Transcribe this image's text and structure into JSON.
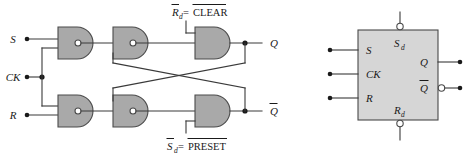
{
  "figure": {
    "colors": {
      "background": "#ffffff",
      "gate_fill": "#a9a9a9",
      "gate_stroke": "#4a4a4a",
      "wire": "#3a3a3a",
      "text": "#1a1a1a",
      "block_fill": "#d6d6d6",
      "block_stroke": "#4a4a4a"
    }
  },
  "circuit": {
    "inputs": [
      {
        "label": "S",
        "name": "input-s"
      },
      {
        "label": "CK",
        "name": "input-ck"
      },
      {
        "label": "R",
        "name": "input-r"
      }
    ],
    "outputs": [
      {
        "label": "Q",
        "overline": false,
        "name": "output-q"
      },
      {
        "label": "Q",
        "overline": true,
        "name": "output-q-bar"
      }
    ],
    "annotations": [
      {
        "name": "clear-annotation",
        "lhs": "R",
        "lhs_sub": "d",
        "lhs_overline": true,
        "equals": "=",
        "rhs": "CLEAR",
        "rhs_overline": true
      },
      {
        "name": "preset-annotation",
        "lhs": "S",
        "lhs_sub": "d",
        "lhs_overline": true,
        "equals": "=",
        "rhs": "PRESET",
        "rhs_overline": true
      }
    ],
    "gates": [
      {
        "name": "nand-gate-top-input",
        "type": "NAND",
        "bubble": true
      },
      {
        "name": "nand-gate-top-middle",
        "type": "NAND",
        "bubble": true
      },
      {
        "name": "and-gate-top-output",
        "type": "AND",
        "bubble": false
      },
      {
        "name": "nand-gate-bottom-input",
        "type": "NAND",
        "bubble": true
      },
      {
        "name": "nand-gate-bottom-middle",
        "type": "NAND",
        "bubble": true
      },
      {
        "name": "and-gate-bottom-output",
        "type": "AND",
        "bubble": false
      }
    ]
  },
  "block_symbol": {
    "name": "flip-flop-block",
    "left_pins": [
      {
        "label": "S",
        "name": "block-pin-s"
      },
      {
        "label": "CK",
        "name": "block-pin-ck"
      },
      {
        "label": "R",
        "name": "block-pin-r"
      }
    ],
    "top_pin": {
      "label": "S",
      "sub": "d",
      "bubble": true,
      "name": "block-pin-sd"
    },
    "bottom_pin": {
      "label": "R",
      "sub": "d",
      "bubble": true,
      "name": "block-pin-rd"
    },
    "right_pins": [
      {
        "label": "Q",
        "bubble": false,
        "name": "block-pin-q"
      },
      {
        "label": "Q",
        "bubble": true,
        "name": "block-pin-q-bar"
      }
    ]
  }
}
